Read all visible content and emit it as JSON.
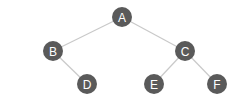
{
  "diagram": {
    "type": "binary-tree",
    "colors": {
      "node_fill": "#5a5a5a",
      "node_text": "#ffffff",
      "edge": "#c9c9c9",
      "background": "#ffffff"
    },
    "nodes": [
      {
        "id": "A",
        "label": "A",
        "x": 122,
        "y": 17
      },
      {
        "id": "B",
        "label": "B",
        "x": 53,
        "y": 51
      },
      {
        "id": "C",
        "label": "C",
        "x": 185,
        "y": 51
      },
      {
        "id": "D",
        "label": "D",
        "x": 87,
        "y": 84
      },
      {
        "id": "E",
        "label": "E",
        "x": 154,
        "y": 84
      },
      {
        "id": "F",
        "label": "F",
        "x": 217,
        "y": 84
      }
    ],
    "edges": [
      {
        "from": "A",
        "to": "B"
      },
      {
        "from": "A",
        "to": "C"
      },
      {
        "from": "B",
        "to": "D"
      },
      {
        "from": "C",
        "to": "E"
      },
      {
        "from": "C",
        "to": "F"
      }
    ]
  }
}
